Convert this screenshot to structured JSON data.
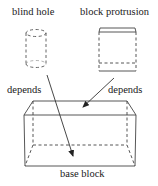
{
  "diagram": {
    "type": "dependency-diagram",
    "nodes": [
      {
        "id": "blind_hole",
        "label": "blind hole",
        "shape": "dashed-cylinder"
      },
      {
        "id": "block_protrusion",
        "label": "block protrusion",
        "shape": "box"
      },
      {
        "id": "base_block",
        "label": "base block",
        "shape": "3d-box"
      }
    ],
    "edges": [
      {
        "from": "blind_hole",
        "to": "base_block",
        "label": "depends"
      },
      {
        "from": "block_protrusion",
        "to": "base_block",
        "label": "depends"
      }
    ],
    "colors": {
      "line": "#333333",
      "text": "#1a1a1a",
      "background": "#ffffff"
    }
  },
  "labels": {
    "blind_hole": "blind hole",
    "block_protrusion": "block protrusion",
    "depends_left": "depends",
    "depends_right": "depends",
    "base_block": "base block"
  }
}
